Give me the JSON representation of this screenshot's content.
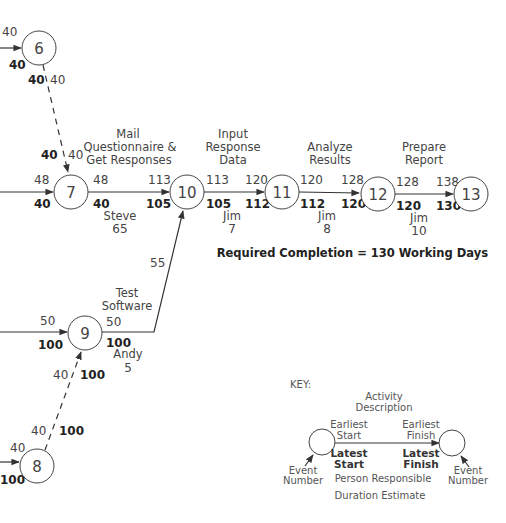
{
  "nodes": {
    "n6": {
      "id": "6"
    },
    "n7": {
      "id": "7"
    },
    "n8": {
      "id": "8"
    },
    "n9": {
      "id": "9"
    },
    "n10": {
      "id": "10"
    },
    "n11": {
      "id": "11"
    },
    "n12": {
      "id": "12"
    },
    "n13": {
      "id": "13"
    }
  },
  "incoming": {
    "n6": {
      "es": "40",
      "ls": "40"
    },
    "n7": {
      "es": "48",
      "ls": "40"
    },
    "n9": {
      "es": "50",
      "ls": "100"
    },
    "n8": {
      "es": "40",
      "ls": "100"
    }
  },
  "dummy_edges": {
    "e6_7": {
      "start_es": "40",
      "start_ls": "40",
      "end_es": "40",
      "end_ls": "40"
    },
    "e8_9": {
      "start_es": "40",
      "start_ls": "100",
      "end_es": "40",
      "end_ls": "100"
    }
  },
  "activities": {
    "mail": {
      "desc_line1": "Mail",
      "desc_line2": "Questionnaire  &",
      "desc_line3": "Get Responses",
      "es": "48",
      "ls": "40",
      "ef": "113",
      "lf": "105",
      "person": "Steve",
      "duration": "65"
    },
    "input": {
      "desc_line1": "Input",
      "desc_line2": "Response",
      "desc_line3": "Data",
      "es": "113",
      "ls": "105",
      "ef": "120",
      "lf": "112",
      "person": "Jim",
      "duration": "7"
    },
    "analyze": {
      "desc_line1": "Analyze",
      "desc_line2": "Results",
      "es": "120",
      "ls": "112",
      "ef": "128",
      "lf": "120",
      "person": "Jim",
      "duration": "8"
    },
    "prepare": {
      "desc_line1": "Prepare",
      "desc_line2": "Report",
      "es": "128",
      "ls": "120",
      "ef": "138",
      "lf": "130",
      "person": "Jim",
      "duration": "10"
    },
    "test": {
      "desc_line1": "Test",
      "desc_line2": "Software",
      "es": "50",
      "ls": "100",
      "person": "Andy",
      "duration": "5",
      "slack_label": "55"
    }
  },
  "required_completion": "Required Completion = 130 Working Days",
  "key": {
    "title": "KEY:",
    "activity_desc_1": "Activity",
    "activity_desc_2": "Description",
    "earliest_start_1": "Earliest",
    "earliest_start_2": "Start",
    "earliest_finish_1": "Earliest",
    "earliest_finish_2": "Finish",
    "latest_start_1": "Latest",
    "latest_start_2": "Start",
    "latest_finish_1": "Latest",
    "latest_finish_2": "Finish",
    "event_number_1": "Event",
    "event_number_2": "Number",
    "person_responsible": "Person Responsible",
    "duration_estimate": "Duration Estimate"
  }
}
